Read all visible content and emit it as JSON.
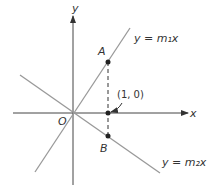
{
  "diagram": {
    "axes": {
      "x_label": "x",
      "y_label": "y",
      "origin_label": "O"
    },
    "lines": [
      {
        "id": "m1",
        "label": "y = m₁x",
        "color": "#999999"
      },
      {
        "id": "m2",
        "label": "y = m₂x",
        "color": "#999999"
      }
    ],
    "points": [
      {
        "id": "A",
        "label": "A"
      },
      {
        "id": "P",
        "label": "(1, 0)"
      },
      {
        "id": "B",
        "label": "B"
      }
    ]
  }
}
